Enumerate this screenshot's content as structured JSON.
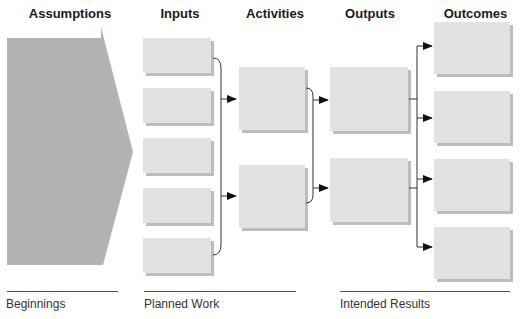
{
  "headers": {
    "assumptions": "Assumptions",
    "inputs": "Inputs",
    "activities": "Activities",
    "outputs": "Outputs",
    "outcomes": "Outcomes"
  },
  "footers": {
    "beginnings": "Beginnings",
    "planned_work": "Planned Work",
    "intended_results": "Intended Results"
  },
  "columns": {
    "inputs": {
      "count": 5
    },
    "activities": {
      "count": 2
    },
    "outputs": {
      "count": 2
    },
    "outcomes": {
      "count": 4
    }
  },
  "colors": {
    "assumptions_fill": "#b3b3b3",
    "box_fill": "#e2e2e2",
    "box_shadow": "#bdbdbd",
    "connector": "#333333",
    "arrowhead": "#111111"
  }
}
